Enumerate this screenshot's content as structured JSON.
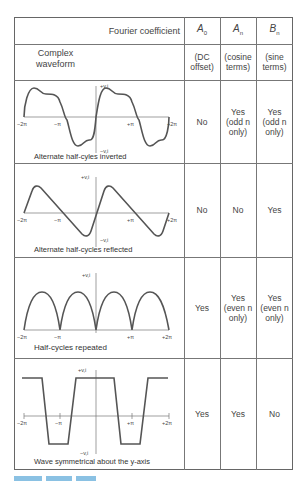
{
  "table": {
    "header": {
      "fourier_coefficient_label": "Fourier coefficient",
      "complex_waveform_label_line1": "Complex",
      "complex_waveform_label_line2": "waveform",
      "columns": [
        {
          "symbol": "A",
          "subscript": "0",
          "desc_line1": "(DC",
          "desc_line2": "offset)"
        },
        {
          "symbol": "A",
          "subscript": "n",
          "desc_line1": "(cosine",
          "desc_line2": "terms)"
        },
        {
          "symbol": "B",
          "subscript": "n",
          "desc_line1": "(sine",
          "desc_line2": "terms)"
        }
      ]
    },
    "rows": [
      {
        "caption": "Alternate half-cyles inverted",
        "a0": [
          "No"
        ],
        "an": [
          "Yes",
          "(odd n",
          "only)"
        ],
        "bn": [
          "Yes",
          "(odd n",
          "only)"
        ]
      },
      {
        "caption": "Alternate half-cycles reflected",
        "a0": [
          "No"
        ],
        "an": [
          "No"
        ],
        "bn": [
          "Yes"
        ]
      },
      {
        "caption": "Half-cycles repeated",
        "a0": [
          "Yes"
        ],
        "an": [
          "Yes",
          "(even n",
          "only)"
        ],
        "bn": [
          "Yes",
          "(even n",
          "only)"
        ]
      },
      {
        "caption": "Wave symmetrical about the y-axis",
        "a0": [
          "Yes"
        ],
        "an": [
          "Yes"
        ],
        "bn": [
          "No"
        ]
      }
    ]
  },
  "axis_labels": {
    "pos_y": "+v,i",
    "neg_y": "−v,i",
    "neg_2pi": "−2π",
    "neg_pi": "−π",
    "pos_pi": "+π",
    "pos_2pi": "+2π"
  },
  "colors": {
    "wave": "#555555",
    "grid": "#777777",
    "caption": "#5aa8d8"
  }
}
